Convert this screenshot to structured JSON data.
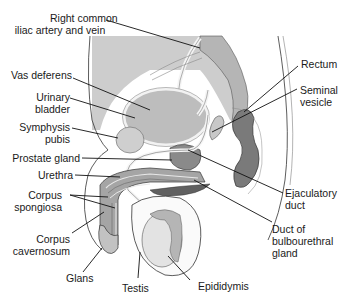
{
  "diagram": {
    "colors": {
      "background_tissue": "#c9c9c9",
      "organ_light": "#bdbdbd",
      "organ_medium": "#9a9a9a",
      "organ_dark": "#6e6e6e",
      "testis": "#e6e6e6",
      "outline": "#2a2a2a",
      "leader_line": "#111111"
    },
    "labels": {
      "right_common_iliac_line1": "Right common",
      "right_common_iliac_line2": "iliac artery and vein",
      "vas_deferens": "Vas deferens",
      "urinary_line1": "Urinary",
      "urinary_line2": "bladder",
      "symphysis_line1": "Symphysis",
      "symphysis_line2": "pubis",
      "prostate": "Prostate gland",
      "urethra": "Urethra",
      "corpus_spong_line1": "Corpus",
      "corpus_spong_line2": "spongiosa",
      "corpus_cav_line1": "Corpus",
      "corpus_cav_line2": "cavernosum",
      "glans": "Glans",
      "testis": "Testis",
      "epididymis": "Epididymis",
      "rectum": "Rectum",
      "seminal_line1": "Seminal",
      "seminal_line2": "vesicle",
      "ejaculatory_line1": "Ejaculatory",
      "ejaculatory_line2": "duct",
      "bulbo_line1": "Duct of",
      "bulbo_line2": "bulbourethral",
      "bulbo_line3": "gland"
    }
  }
}
